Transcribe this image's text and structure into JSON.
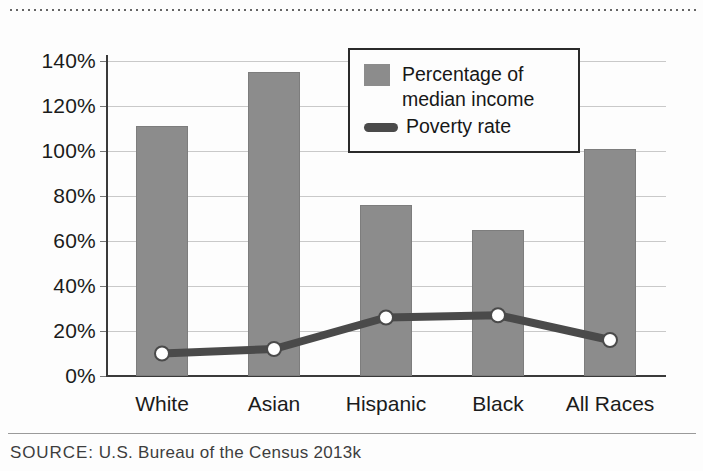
{
  "chart_data": {
    "type": "bar",
    "title": "",
    "xlabel": "",
    "ylabel": "",
    "ylim": [
      0,
      140
    ],
    "grid": true,
    "legend_position": "top-right",
    "categories": [
      "White",
      "Asian",
      "Hispanic",
      "Black",
      "All Races"
    ],
    "ytick_labels": [
      "0%",
      "20%",
      "40%",
      "60%",
      "80%",
      "100%",
      "120%",
      "140%"
    ],
    "ytick_values": [
      0,
      20,
      40,
      60,
      80,
      100,
      120,
      140
    ],
    "series": [
      {
        "name": "Percentage of median income",
        "type": "bar",
        "color": "#8c8c8c",
        "values": [
          111,
          135,
          76,
          65,
          101
        ]
      },
      {
        "name": "Poverty rate",
        "type": "line",
        "color": "#4a4a4a",
        "marker": "circle-white",
        "values": [
          10,
          12,
          26,
          27,
          16
        ]
      }
    ]
  },
  "legend": {
    "items": [
      {
        "label": "Percentage of\nmedian income",
        "marker": "swatch",
        "color": "#8c8c8c"
      },
      {
        "label": "Poverty rate",
        "marker": "line",
        "color": "#4a4a4a"
      }
    ]
  },
  "footer": {
    "source_label": "SOURCE:",
    "source_text": "U.S. Bureau of the Census 2013k"
  }
}
